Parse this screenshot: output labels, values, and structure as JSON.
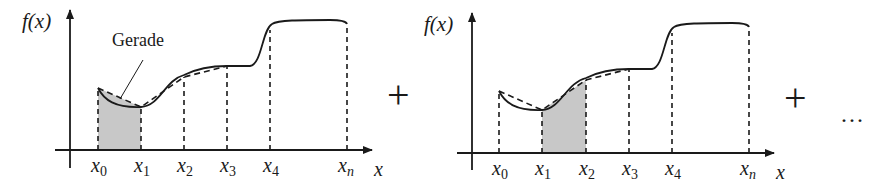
{
  "figure": {
    "colors": {
      "stroke": "#1a1a1a",
      "fill_shaded": "#c8c8c8",
      "background": "#ffffff"
    },
    "panels": [
      {
        "id": "panel-1",
        "y_label": "f(x)",
        "x_label": "x",
        "annotation": "Gerade",
        "ticks": [
          {
            "name": "x",
            "sub": "0"
          },
          {
            "name": "x",
            "sub": "1"
          },
          {
            "name": "x",
            "sub": "2"
          },
          {
            "name": "x",
            "sub": "3"
          },
          {
            "name": "x",
            "sub": "4"
          },
          {
            "name": "x",
            "sub": "n"
          }
        ],
        "shaded_interval": [
          "x0",
          "x1"
        ]
      },
      {
        "id": "panel-2",
        "y_label": "f(x)",
        "x_label": "x",
        "ticks": [
          {
            "name": "x",
            "sub": "0"
          },
          {
            "name": "x",
            "sub": "1"
          },
          {
            "name": "x",
            "sub": "2"
          },
          {
            "name": "x",
            "sub": "3"
          },
          {
            "name": "x",
            "sub": "4"
          },
          {
            "name": "x",
            "sub": "n"
          }
        ],
        "shaded_interval": [
          "x1",
          "x2"
        ]
      }
    ],
    "operators": {
      "plus_1": "+",
      "plus_2": "+",
      "ellipsis": "···"
    }
  }
}
